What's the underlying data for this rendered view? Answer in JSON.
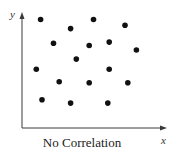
{
  "chart_data": {
    "type": "scatter",
    "title": "No Correlation",
    "xlabel": "x",
    "ylabel": "y",
    "xlim": [
      0,
      10
    ],
    "ylim": [
      0,
      10
    ],
    "grid": false,
    "legend": null,
    "tick_labels": {
      "x": [],
      "y": []
    },
    "series": [
      {
        "name": "points",
        "color": "#111111",
        "points": [
          {
            "x": 1.3,
            "y": 9.6
          },
          {
            "x": 5.0,
            "y": 9.6
          },
          {
            "x": 7.2,
            "y": 9.1
          },
          {
            "x": 3.4,
            "y": 8.8
          },
          {
            "x": 2.2,
            "y": 7.5
          },
          {
            "x": 4.7,
            "y": 7.3
          },
          {
            "x": 6.1,
            "y": 7.6
          },
          {
            "x": 8.0,
            "y": 6.9
          },
          {
            "x": 3.8,
            "y": 6.1
          },
          {
            "x": 1.0,
            "y": 5.2
          },
          {
            "x": 6.1,
            "y": 5.2
          },
          {
            "x": 2.6,
            "y": 4.1
          },
          {
            "x": 4.7,
            "y": 4.0
          },
          {
            "x": 7.4,
            "y": 4.0
          },
          {
            "x": 1.4,
            "y": 2.5
          },
          {
            "x": 3.4,
            "y": 2.2
          },
          {
            "x": 6.0,
            "y": 2.2
          }
        ]
      }
    ]
  },
  "labels": {
    "title": "No Correlation",
    "x_axis": "x",
    "y_axis": "y"
  },
  "colors": {
    "axis": "#3a3a3a",
    "dot": "#111111",
    "background": "#ffffff"
  }
}
